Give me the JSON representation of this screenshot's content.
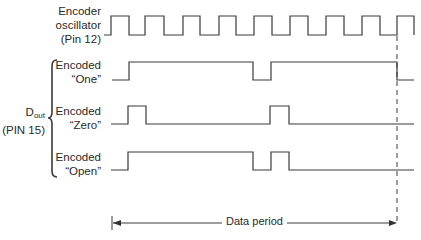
{
  "diagram": {
    "type": "timing-diagram",
    "signals": [
      {
        "id": "osc",
        "label_line1": "Encoder",
        "label_line2": "oscillator",
        "label_line3": "(Pin 12)",
        "edges_x": [
          111,
          129,
          145,
          164,
          183,
          200,
          219,
          236,
          254,
          272,
          290,
          308,
          326,
          344,
          362,
          380,
          397,
          414
        ],
        "start_level": "low"
      },
      {
        "id": "one",
        "label_line1": "Encoded",
        "label_line2": "“One”",
        "waveform": "low, high (long), low (1 osc period), high (long), low"
      },
      {
        "id": "zero",
        "label_line1": "Encoded",
        "label_line2": "“Zero”",
        "waveform": "low, short high pulse, long low, short high pulse, low"
      },
      {
        "id": "open",
        "label_line1": "Encoded",
        "label_line2": "“Open”",
        "waveform": "low, long high, short low, short high, low"
      }
    ],
    "group": {
      "label_main": "D",
      "label_sub": "out",
      "label_pin": "(PIN 15)"
    },
    "period": {
      "label": "Data period"
    },
    "colors": {
      "line": "#333333",
      "background": "#ffffff"
    }
  }
}
